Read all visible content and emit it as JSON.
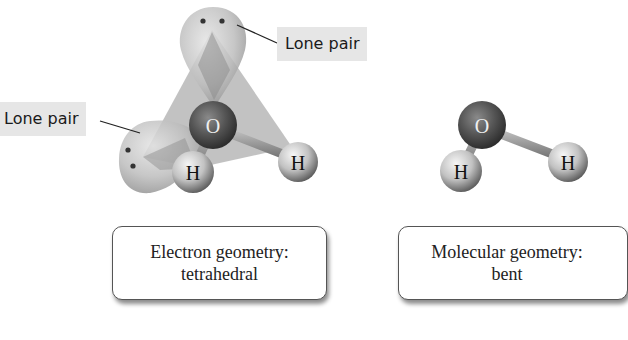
{
  "figure": {
    "left_panel": {
      "labels": {
        "lone_pair_top": "Lone pair",
        "lone_pair_left": "Lone pair"
      },
      "atoms": {
        "central": "O",
        "h_left": "H",
        "h_right": "H"
      },
      "caption": {
        "line1": "Electron geometry:",
        "line2": "tetrahedral"
      }
    },
    "right_panel": {
      "atoms": {
        "central": "O",
        "h_left": "H",
        "h_right": "H"
      },
      "caption": {
        "line1": "Molecular geometry:",
        "line2": "bent"
      }
    }
  },
  "colors": {
    "lone_pair_lobe": "#b9b9b9",
    "tetrahedron_face": "#8e8e8e",
    "oxygen": "#555555",
    "hydrogen": "#c8c8c8",
    "label_bg": "#e6e6e6"
  }
}
